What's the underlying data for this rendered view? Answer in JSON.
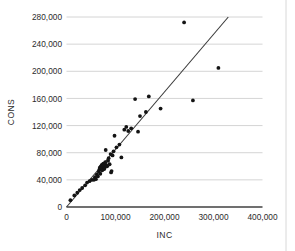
{
  "chart_data": {
    "type": "scatter",
    "title": "",
    "xlabel": "INC",
    "ylabel": "CONS",
    "xlim": [
      0,
      400000
    ],
    "ylim": [
      0,
      280000
    ],
    "xticks": [
      0,
      100000,
      200000,
      300000,
      400000
    ],
    "yticks": [
      0,
      40000,
      80000,
      120000,
      160000,
      200000,
      240000,
      280000
    ],
    "xtick_labels": [
      "0",
      "100,000",
      "200,000",
      "300,000",
      "400,000"
    ],
    "ytick_labels": [
      "0",
      "40,000",
      "80,000",
      "120,000",
      "160,000",
      "200,000",
      "240,000",
      "280,000"
    ],
    "grid": "horizontal",
    "legend": "none",
    "marker_color": "#141414",
    "gridline_color": "#c9c9c9",
    "trendline_color": "#3a3a3a",
    "axis_color": "#404040",
    "trendline": {
      "x_start": 0,
      "y_start": 0,
      "x_end": 336000,
      "y_end": 285000,
      "slope": 0.848,
      "intercept": 0
    },
    "points": [
      {
        "x": 8000,
        "y": 10000
      },
      {
        "x": 16000,
        "y": 17000
      },
      {
        "x": 22000,
        "y": 21000
      },
      {
        "x": 27000,
        "y": 25000
      },
      {
        "x": 32000,
        "y": 28000
      },
      {
        "x": 38000,
        "y": 32000
      },
      {
        "x": 42000,
        "y": 36000
      },
      {
        "x": 47000,
        "y": 38000
      },
      {
        "x": 52000,
        "y": 40000
      },
      {
        "x": 56000,
        "y": 40000
      },
      {
        "x": 58000,
        "y": 44000
      },
      {
        "x": 60000,
        "y": 41000
      },
      {
        "x": 62000,
        "y": 48000
      },
      {
        "x": 64000,
        "y": 45000
      },
      {
        "x": 66000,
        "y": 52000
      },
      {
        "x": 67000,
        "y": 55000
      },
      {
        "x": 68000,
        "y": 58000
      },
      {
        "x": 69000,
        "y": 49000
      },
      {
        "x": 70000,
        "y": 60000
      },
      {
        "x": 71000,
        "y": 57000
      },
      {
        "x": 72000,
        "y": 62000
      },
      {
        "x": 73000,
        "y": 54000
      },
      {
        "x": 74000,
        "y": 59000
      },
      {
        "x": 75000,
        "y": 64000
      },
      {
        "x": 76000,
        "y": 61000
      },
      {
        "x": 77000,
        "y": 56000
      },
      {
        "x": 78000,
        "y": 58000
      },
      {
        "x": 79000,
        "y": 66000
      },
      {
        "x": 80000,
        "y": 84000
      },
      {
        "x": 81000,
        "y": 62000
      },
      {
        "x": 83000,
        "y": 60000
      },
      {
        "x": 85000,
        "y": 68000
      },
      {
        "x": 86000,
        "y": 72000
      },
      {
        "x": 88000,
        "y": 63000
      },
      {
        "x": 90000,
        "y": 78000
      },
      {
        "x": 91000,
        "y": 51000
      },
      {
        "x": 92000,
        "y": 53000
      },
      {
        "x": 94000,
        "y": 76000
      },
      {
        "x": 96000,
        "y": 82000
      },
      {
        "x": 98000,
        "y": 105000
      },
      {
        "x": 102000,
        "y": 88000
      },
      {
        "x": 108000,
        "y": 92000
      },
      {
        "x": 112000,
        "y": 73000
      },
      {
        "x": 118000,
        "y": 114000
      },
      {
        "x": 122000,
        "y": 118000
      },
      {
        "x": 126000,
        "y": 112000
      },
      {
        "x": 132000,
        "y": 116000
      },
      {
        "x": 140000,
        "y": 159000
      },
      {
        "x": 146000,
        "y": 111000
      },
      {
        "x": 150000,
        "y": 134000
      },
      {
        "x": 162000,
        "y": 140000
      },
      {
        "x": 168000,
        "y": 163000
      },
      {
        "x": 192000,
        "y": 145000
      },
      {
        "x": 240000,
        "y": 272000
      },
      {
        "x": 258000,
        "y": 157000
      },
      {
        "x": 310000,
        "y": 205000
      }
    ]
  }
}
